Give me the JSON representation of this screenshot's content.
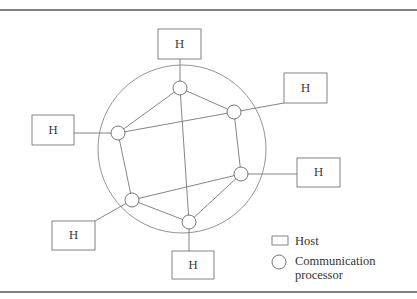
{
  "diagram": {
    "type": "network-topology",
    "ring": {
      "cx": 182,
      "cy": 149,
      "r": 84
    },
    "nodes": [
      {
        "id": "cp-top",
        "x": 180,
        "y": 88
      },
      {
        "id": "cp-right-top",
        "x": 234,
        "y": 112
      },
      {
        "id": "cp-left",
        "x": 118,
        "y": 133
      },
      {
        "id": "cp-right",
        "x": 241,
        "y": 174
      },
      {
        "id": "cp-bottom-left",
        "x": 132,
        "y": 200
      },
      {
        "id": "cp-bottom",
        "x": 189,
        "y": 222
      }
    ],
    "edges": [
      [
        "cp-top",
        "cp-right-top"
      ],
      [
        "cp-top",
        "cp-left"
      ],
      [
        "cp-top",
        "cp-bottom"
      ],
      [
        "cp-right-top",
        "cp-left"
      ],
      [
        "cp-right-top",
        "cp-right"
      ],
      [
        "cp-left",
        "cp-bottom-left"
      ],
      [
        "cp-right",
        "cp-bottom-left"
      ],
      [
        "cp-right",
        "cp-bottom"
      ],
      [
        "cp-bottom-left",
        "cp-bottom"
      ]
    ],
    "hosts": [
      {
        "id": "host-top",
        "label": "H",
        "x": 158,
        "y": 29,
        "w": 43,
        "h": 30,
        "attach": "cp-top"
      },
      {
        "id": "host-right-top",
        "label": "H",
        "x": 284,
        "y": 73,
        "w": 43,
        "h": 30,
        "attach": "cp-right-top"
      },
      {
        "id": "host-left",
        "label": "H",
        "x": 32,
        "y": 115,
        "w": 42,
        "h": 30,
        "attach": "cp-left"
      },
      {
        "id": "host-right",
        "label": "H",
        "x": 297,
        "y": 158,
        "w": 43,
        "h": 29,
        "attach": "cp-right"
      },
      {
        "id": "host-bottom-left",
        "label": "H",
        "x": 52,
        "y": 221,
        "w": 43,
        "h": 29,
        "attach": "cp-bottom-left"
      },
      {
        "id": "host-bottom",
        "label": "H",
        "x": 172,
        "y": 251,
        "w": 42,
        "h": 28,
        "attach": "cp-bottom"
      }
    ]
  },
  "legend": {
    "host_label": "Host",
    "processor_label_line1": "Communication",
    "processor_label_line2": "processor"
  }
}
